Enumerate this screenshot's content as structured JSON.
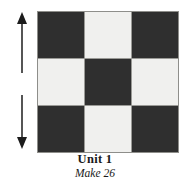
{
  "figure": {
    "name": "quilt-unit-diagram",
    "background_color": "#ffffff"
  },
  "arrow": {
    "name": "vertical-double-arrow",
    "orientation": "vertical",
    "heads": "both",
    "color": "#2b2b2b",
    "meaning": "grain / length direction indicator"
  },
  "block": {
    "rows": 3,
    "columns": 3,
    "dark_color": "#2f2f2f",
    "light_color": "#f0f0ee",
    "gridline_color": "#9a9a96",
    "pattern": [
      [
        "dark",
        "light",
        "dark"
      ],
      [
        "light",
        "dark",
        "light"
      ],
      [
        "dark",
        "light",
        "dark"
      ]
    ]
  },
  "caption": {
    "title": "Unit 1",
    "make": "Make 26"
  }
}
